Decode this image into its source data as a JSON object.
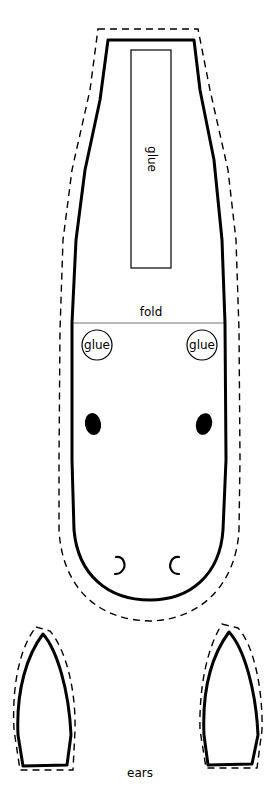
{
  "template": {
    "type": "craft-cutout",
    "colors": {
      "ink": "#000000",
      "paper": "#ffffff"
    }
  },
  "body_piece": {
    "glue_strip_label": "glue",
    "fold_label": "fold",
    "glue_spots": [
      {
        "label": "glue",
        "position": "left"
      },
      {
        "label": "glue",
        "position": "right"
      }
    ],
    "eyes": 2,
    "nostrils": 2
  },
  "ears_piece": {
    "label": "ears",
    "count": 2
  }
}
